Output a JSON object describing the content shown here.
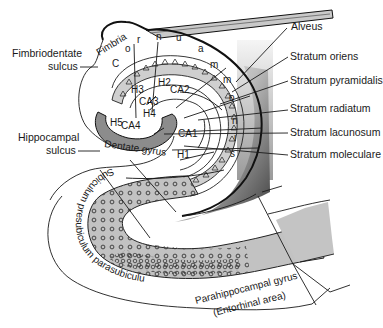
{
  "diagram": {
    "type": "anatomical-cross-section",
    "colors": {
      "background": "#ffffff",
      "outline": "#111111",
      "dentate_fill": "#8c8c8c",
      "subiculum_fill": "#bdbdbd",
      "parahippocampal_fill": "#c4c4c4",
      "ventricle_gradient_dark": "#4a4a4a",
      "ventricle_gradient_light": "#ececec"
    }
  },
  "labels": {
    "left": {
      "fimbriodentate_sulcus_line1": "Fimbriodentate",
      "fimbriodentate_sulcus_line2": "sulcus",
      "hippocampal_sulcus_line1": "Hippocampal",
      "hippocampal_sulcus_line2": "sulcus"
    },
    "right": {
      "alveus": "Alveus",
      "stratum_oriens": "Stratum oriens",
      "stratum_pyramidalis": "Stratum pyramidalis",
      "stratum_radiatum": "Stratum radiatum",
      "stratum_lacunosum": "Stratum lacunosum",
      "stratum_moleculare": "Stratum moleculare"
    },
    "inline": {
      "fimbria": "Fimbria",
      "ca1": "CA1",
      "ca2": "CA2",
      "ca3": "CA3",
      "ca4": "CA4",
      "h1": "H1",
      "h2": "H2",
      "h3": "H3",
      "h4": "H4",
      "h5": "H5",
      "dentate_gyrus": "Dentate gyrus",
      "subiculum_text": "Subiculum presubiculum parasubiculum",
      "parahippocampal_line1": "Parahippocampal gyrus",
      "parahippocampal_line2": "(Entorhinal area)"
    },
    "cornu_ammonis_letters": [
      "C",
      "o",
      "r",
      "n",
      "u",
      "a",
      "m",
      "m",
      "o",
      "n",
      "i",
      "s"
    ]
  }
}
